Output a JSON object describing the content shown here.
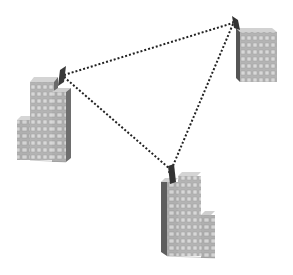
{
  "diagram": {
    "type": "wireless-network",
    "colors": {
      "background": "#ffffff",
      "link": "#222222",
      "building_front": "#b8b8b8",
      "building_side": "#6e6e6e",
      "building_top": "#d6d6d6",
      "window": "#d9d9d9",
      "dish": "#3a3a3a"
    },
    "nodes": [
      {
        "id": "building-left",
        "label": "",
        "antenna": [
          63,
          75
        ]
      },
      {
        "id": "building-right",
        "label": "",
        "antenna": [
          234,
          22
        ]
      },
      {
        "id": "building-bottom",
        "label": "",
        "antenna": [
          171,
          170
        ]
      }
    ],
    "links": [
      {
        "from": "building-left",
        "to": "building-right",
        "style": "dotted"
      },
      {
        "from": "building-left",
        "to": "building-bottom",
        "style": "dotted"
      },
      {
        "from": "building-right",
        "to": "building-bottom",
        "style": "dotted"
      }
    ]
  }
}
